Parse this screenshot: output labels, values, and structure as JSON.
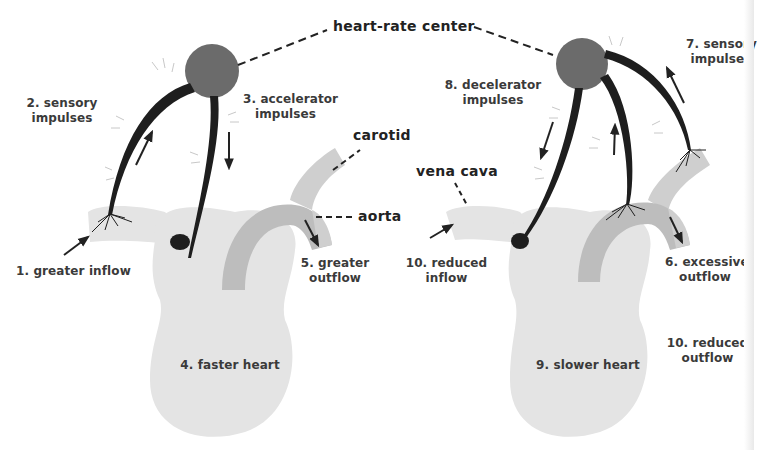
{
  "diagram": {
    "title": "heart-rate center",
    "colors": {
      "center_node": "#6b6b6b",
      "heart_fill": "#e4e4e4",
      "vessel_fill": "#cfcfcf",
      "aorta_fill": "#bdbdbd",
      "nerve": "#1e1e1e",
      "label": "#3a3a3a"
    },
    "left_panel": {
      "name": "faster heart",
      "labels": {
        "inflow": "1. greater inflow",
        "sensory_line1": "2. sensory",
        "sensory_line2": "impulses",
        "accel_line1": "3. accelerator",
        "accel_line2": "impulses",
        "heart": "4. faster heart",
        "outflow_line1": "5. greater",
        "outflow_line2": "outflow",
        "carotid": "carotid",
        "aorta": "aorta"
      }
    },
    "right_panel": {
      "name": "slower heart",
      "labels": {
        "vena_cava": "vena cava",
        "excess_line1": "6. excessive",
        "excess_line2": "outflow",
        "sensory_line1": "7. sensory",
        "sensory_line2": "impulses",
        "decel_line1": "8. decelerator",
        "decel_line2": "impulses",
        "heart": "9. slower heart",
        "inflow_line1": "10. reduced",
        "inflow_line2": "inflow",
        "outflow_line1": "10. reduced",
        "outflow_line2": "outflow"
      }
    }
  }
}
